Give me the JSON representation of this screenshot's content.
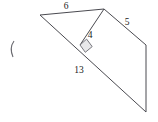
{
  "figure": {
    "background_color": "#ffffff",
    "stroke_color": "#4a4a50",
    "label_color": "#1a1a1a",
    "vertices": {
      "left": [
        40,
        15
      ],
      "apex": [
        104,
        9
      ],
      "foot": [
        80,
        45
      ],
      "right_corner": [
        146,
        45
      ],
      "bottom": [
        146,
        112
      ]
    },
    "segments": [
      {
        "name": "top-side-6",
        "from": "left",
        "to": "apex"
      },
      {
        "name": "hypotenuse-13",
        "from": "left",
        "to": "bottom"
      },
      {
        "name": "altitude-4",
        "from": "apex",
        "to": "foot"
      },
      {
        "name": "side-5",
        "from": "apex",
        "to": "right_corner"
      },
      {
        "name": "vertical-side",
        "from": "right_corner",
        "to": "bottom"
      }
    ],
    "right_angle_marker": {
      "name": "right-angle-at-foot",
      "at": "foot"
    },
    "labels": [
      {
        "name": "label-6",
        "text": "6",
        "x": 66,
        "y": 9
      },
      {
        "name": "label-5",
        "text": "5",
        "x": 127,
        "y": 25
      },
      {
        "name": "label-4",
        "text": "4",
        "x": 90,
        "y": 38
      },
      {
        "name": "label-13",
        "text": "13",
        "x": 74,
        "y": 73
      }
    ],
    "side_mark": {
      "name": "paren-tick-mark",
      "x": 12,
      "y": 48
    }
  }
}
